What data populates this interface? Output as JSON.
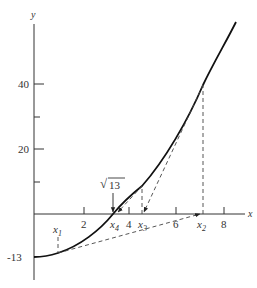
{
  "diagram": {
    "axes": {
      "x_label": "x",
      "y_label": "y",
      "x_ticks": [
        {
          "value": 2,
          "label": "2",
          "px": 84
        },
        {
          "value": 4,
          "label": "4",
          "px": 129
        },
        {
          "value": 6,
          "label": "6",
          "px": 176
        },
        {
          "value": 8,
          "label": "8",
          "px": 224
        }
      ],
      "y_ticks": [
        {
          "value": 40,
          "label": "40",
          "py": 84
        },
        {
          "value": 30,
          "label": "",
          "py": 117
        },
        {
          "value": 20,
          "label": "20",
          "py": 149
        },
        {
          "value": 10,
          "label": "",
          "py": 182
        }
      ],
      "y_intercept_label": "-13"
    },
    "iterates": [
      {
        "name": "x1",
        "sub": "1",
        "px": 58
      },
      {
        "name": "x2",
        "sub": "2",
        "px": 202
      },
      {
        "name": "x3",
        "sub": "3",
        "px": 143
      },
      {
        "name": "x4",
        "sub": "4",
        "px": 116
      }
    ],
    "root_label": "13",
    "root_symbol": "√",
    "colors": {
      "curve": "#111111",
      "axis": "#333333",
      "dashed": "#444444"
    }
  }
}
